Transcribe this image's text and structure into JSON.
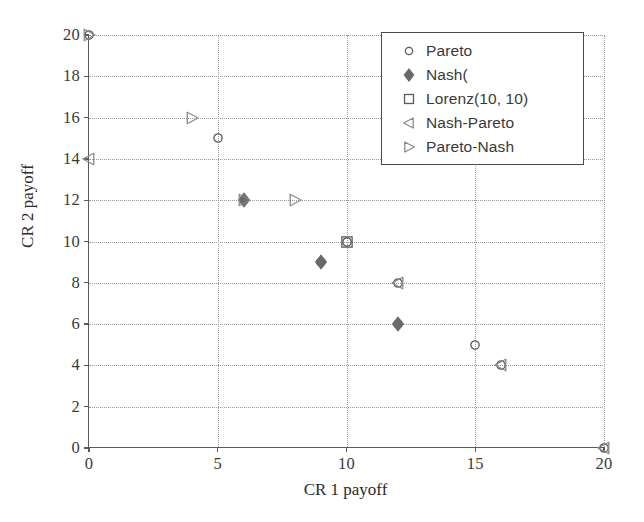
{
  "chart_data": {
    "type": "scatter",
    "title": "",
    "xlabel": "CR 1 payoff",
    "ylabel": "CR 2 payoff",
    "xlim": [
      0,
      20
    ],
    "ylim": [
      0,
      20
    ],
    "xticks": [
      "0",
      "5",
      "10",
      "15",
      "20"
    ],
    "xtick_values": [
      0,
      5,
      10,
      15,
      20
    ],
    "yticks": [
      "0",
      "2",
      "4",
      "6",
      "8",
      "10",
      "12",
      "14",
      "16",
      "18",
      "20"
    ],
    "ytick_values": [
      0,
      2,
      4,
      6,
      8,
      10,
      12,
      14,
      16,
      18,
      20
    ],
    "grid": true,
    "legend_position": "top-right",
    "series": [
      {
        "name": "Pareto",
        "marker": "circle-open",
        "color": "#5a5a5a",
        "points": [
          {
            "x": 0,
            "y": 20
          },
          {
            "x": 5,
            "y": 15
          },
          {
            "x": 6,
            "y": 12
          },
          {
            "x": 9,
            "y": 9
          },
          {
            "x": 10,
            "y": 10
          },
          {
            "x": 12,
            "y": 8
          },
          {
            "x": 12,
            "y": 6
          },
          {
            "x": 15,
            "y": 5
          },
          {
            "x": 16,
            "y": 4
          },
          {
            "x": 20,
            "y": 0
          }
        ]
      },
      {
        "name": "Nash(",
        "marker": "diamond-filled",
        "color": "#6a6a6a",
        "points": [
          {
            "x": 6,
            "y": 12
          },
          {
            "x": 9,
            "y": 9
          },
          {
            "x": 12,
            "y": 6
          }
        ]
      },
      {
        "name": "Lorenz(10, 10)",
        "marker": "square-open",
        "color": "#5a5a5a",
        "points": [
          {
            "x": 10,
            "y": 10
          }
        ]
      },
      {
        "name": "Nash-Pareto",
        "marker": "triangle-left-open",
        "color": "#8a8a8a",
        "points": [
          {
            "x": 0,
            "y": 14
          },
          {
            "x": 12,
            "y": 8
          },
          {
            "x": 16,
            "y": 4
          },
          {
            "x": 20,
            "y": 0
          }
        ]
      },
      {
        "name": "Pareto-Nash",
        "marker": "triangle-right-open",
        "color": "#8a8a8a",
        "points": [
          {
            "x": 0,
            "y": 20
          },
          {
            "x": 4,
            "y": 16
          },
          {
            "x": 6,
            "y": 12
          },
          {
            "x": 8,
            "y": 12
          }
        ]
      }
    ]
  },
  "legend": {
    "entries": [
      {
        "label": "Pareto",
        "marker": "circle-open"
      },
      {
        "label": "Nash(",
        "marker": "diamond-filled"
      },
      {
        "label": "Lorenz(10, 10)",
        "marker": "square-open"
      },
      {
        "label": "Nash-Pareto",
        "marker": "triangle-left-open"
      },
      {
        "label": "Pareto-Nash",
        "marker": "triangle-right-open"
      }
    ]
  },
  "colors": {
    "axis": "#5a5a5a",
    "grid": "#9a9a9a",
    "text": "#2b2b2b",
    "marker_open": "#5a5a5a",
    "marker_filled": "#6a6a6a",
    "marker_triangle": "#8a8a8a"
  }
}
